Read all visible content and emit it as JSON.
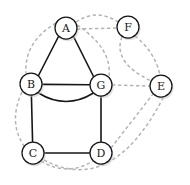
{
  "figure": {
    "type": "graph-diagram",
    "width": 190,
    "height": 185,
    "background_color": "#ffffff"
  },
  "style": {
    "solid_edge_color": "#161616",
    "dashed_edge_color": "#b4b4b4",
    "node_fill": "#ffffff",
    "node_stroke": "#161616",
    "label_color": "#161616",
    "node_radius": 11
  },
  "nodes": [
    {
      "id": "A",
      "label": "A",
      "cx": 66,
      "cy": 28,
      "r": 11
    },
    {
      "id": "F",
      "label": "F",
      "cx": 128,
      "cy": 27,
      "r": 11
    },
    {
      "id": "B",
      "label": "B",
      "cx": 31,
      "cy": 84,
      "r": 11
    },
    {
      "id": "G",
      "label": "G",
      "cx": 101,
      "cy": 85,
      "r": 11
    },
    {
      "id": "E",
      "label": "E",
      "cx": 161,
      "cy": 86,
      "r": 11
    },
    {
      "id": "C",
      "label": "C",
      "cx": 33,
      "cy": 153,
      "r": 11
    },
    {
      "id": "D",
      "label": "D",
      "cx": 101,
      "cy": 153,
      "r": 11
    }
  ],
  "solid_edges": [
    {
      "id": "A-B",
      "from": "A",
      "to": "B",
      "style": "straight",
      "path": "M 58.5,36.5 L 38.5,75.5"
    },
    {
      "id": "A-G",
      "from": "A",
      "to": "G",
      "style": "straight",
      "path": "M 73.5,36.5 L 93.5,76.5"
    },
    {
      "id": "B-G1",
      "from": "B",
      "to": "G",
      "style": "straight",
      "path": "M 42,84.4 L 90,84.8"
    },
    {
      "id": "B-G2",
      "from": "B",
      "to": "G",
      "style": "curved",
      "path": "M 38.5,93 Q 66,110 93.5,93"
    },
    {
      "id": "B-C",
      "from": "B",
      "to": "C",
      "style": "straight",
      "path": "M 31.4,95 L 32.6,142"
    },
    {
      "id": "G-D",
      "from": "G",
      "to": "D",
      "style": "straight",
      "path": "M 101,96 L 101,142"
    },
    {
      "id": "C-D",
      "from": "C",
      "to": "D",
      "style": "straight",
      "path": "M 44,153 L 90,153"
    }
  ],
  "dashed_edges": [
    {
      "id": "A-B-arc",
      "from": "A",
      "to": "B",
      "path": "M 56,23 Q 24,42 26,73"
    },
    {
      "id": "A-G-arc",
      "from": "A",
      "to": "G",
      "path": "M 77,25 Q 112,48 109,76"
    },
    {
      "id": "A-F-1",
      "from": "A",
      "to": "F",
      "path": "M 76,22 Q 97,8 118,22"
    },
    {
      "id": "A-F-2",
      "from": "A",
      "to": "F",
      "path": "M 77,29 L 117,28"
    },
    {
      "id": "F-E-1",
      "from": "F",
      "to": "E",
      "path": "M 122,37 Q 112,62 151,81"
    },
    {
      "id": "F-E-2",
      "from": "F",
      "to": "E",
      "path": "M 135,36 Q 155,52 160,75"
    },
    {
      "id": "G-E",
      "from": "G",
      "to": "E",
      "path": "M 112,85 L 150,86"
    },
    {
      "id": "D-E",
      "from": "D",
      "to": "E",
      "path": "M 111,148 L 153,94"
    },
    {
      "id": "B-C-arc",
      "from": "B",
      "to": "C",
      "path": "M 22,92 Q 8,122 24,146"
    },
    {
      "id": "C-D-arc",
      "from": "C",
      "to": "D",
      "path": "M 41,161 Q 67,177 93,161"
    },
    {
      "id": "C-E-arc",
      "from": "C",
      "to": "E",
      "path": "M 44,160 Q 112,196 163,98"
    }
  ]
}
